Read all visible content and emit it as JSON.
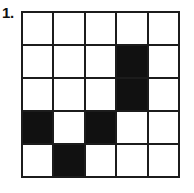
{
  "figure": {
    "item_number": "1.",
    "colors": {
      "filled": "#111111",
      "empty": "#ffffff",
      "grid_line": "#1c1c1c",
      "background": "#ffffff"
    }
  },
  "chart_data": {
    "type": "heatmap",
    "title": "",
    "xlabel": "",
    "ylabel": "",
    "rows": 5,
    "columns": 5,
    "legend": {
      "0": "empty (white)",
      "1": "filled (black)"
    },
    "values": [
      [
        0,
        0,
        0,
        0,
        0
      ],
      [
        0,
        0,
        0,
        1,
        0
      ],
      [
        0,
        0,
        0,
        1,
        0
      ],
      [
        1,
        0,
        1,
        0,
        0
      ],
      [
        0,
        1,
        0,
        0,
        0
      ]
    ],
    "filled_cells": [
      {
        "row": 2,
        "col": 4
      },
      {
        "row": 3,
        "col": 4
      },
      {
        "row": 4,
        "col": 1
      },
      {
        "row": 4,
        "col": 3
      },
      {
        "row": 5,
        "col": 2
      }
    ],
    "filled_count": 5,
    "empty_count": 20
  }
}
